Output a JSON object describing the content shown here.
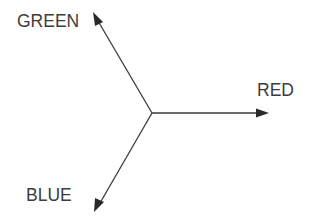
{
  "diagram": {
    "type": "color-vector-axes",
    "line_color": "#3a3a3a",
    "text_color": "#3c3c3c",
    "axes": [
      {
        "id": "green",
        "label": "GREEN",
        "direction": "upper-left"
      },
      {
        "id": "red",
        "label": "RED",
        "direction": "right"
      },
      {
        "id": "blue",
        "label": "BLUE",
        "direction": "lower-left"
      }
    ]
  }
}
